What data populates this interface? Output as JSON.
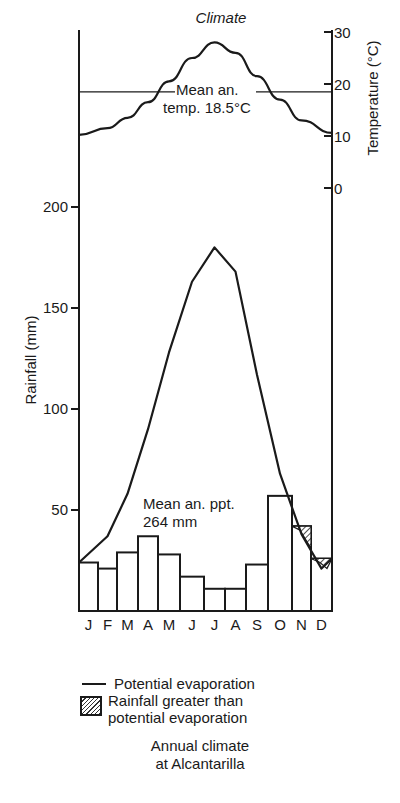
{
  "chart_data": {
    "type": "bar+line",
    "title": "Climate",
    "caption": [
      "Annual climate",
      "at Alcantarilla"
    ],
    "categories": [
      "J",
      "F",
      "M",
      "A",
      "M",
      "J",
      "J",
      "A",
      "S",
      "O",
      "N",
      "D"
    ],
    "series": [
      {
        "name": "Rainfall",
        "type": "bar",
        "axis": "left",
        "unit": "mm",
        "values": [
          24,
          21,
          29,
          37,
          28,
          17,
          11,
          11,
          23,
          57,
          42,
          26
        ]
      },
      {
        "name": "Potential evaporation",
        "type": "line",
        "axis": "left",
        "unit": "mm",
        "values": [
          24,
          37,
          58,
          90,
          128,
          163,
          180,
          168,
          117,
          68,
          38,
          21
        ]
      },
      {
        "name": "Temperature",
        "type": "line",
        "axis": "right",
        "unit": "°C",
        "values": [
          10.2,
          11.5,
          13.5,
          16.5,
          20.5,
          25,
          28,
          26,
          21.5,
          17,
          13,
          10.6
        ]
      }
    ],
    "hatched_months": [
      "N",
      "D"
    ],
    "left_axis": {
      "label": "Rainfall (mm)",
      "ticks": [
        50,
        100,
        150,
        200
      ],
      "ylim": [
        0,
        200
      ]
    },
    "right_axis": {
      "label": "Temperature (°C)",
      "ticks": [
        0,
        10,
        20,
        30
      ],
      "ylim": [
        0,
        30
      ]
    },
    "annotations": [
      {
        "text": [
          "Mean an.",
          "temp. 18.5°C"
        ],
        "value": 18.5,
        "axis": "right"
      },
      {
        "text": [
          "Mean an. ppt.",
          "264 mm"
        ],
        "value": 264
      }
    ],
    "legend": [
      {
        "symbol": "line",
        "label": "Potential evaporation"
      },
      {
        "symbol": "hatch",
        "label": [
          "Rainfall greater than",
          "potential evaporation"
        ]
      }
    ],
    "grid": false
  }
}
